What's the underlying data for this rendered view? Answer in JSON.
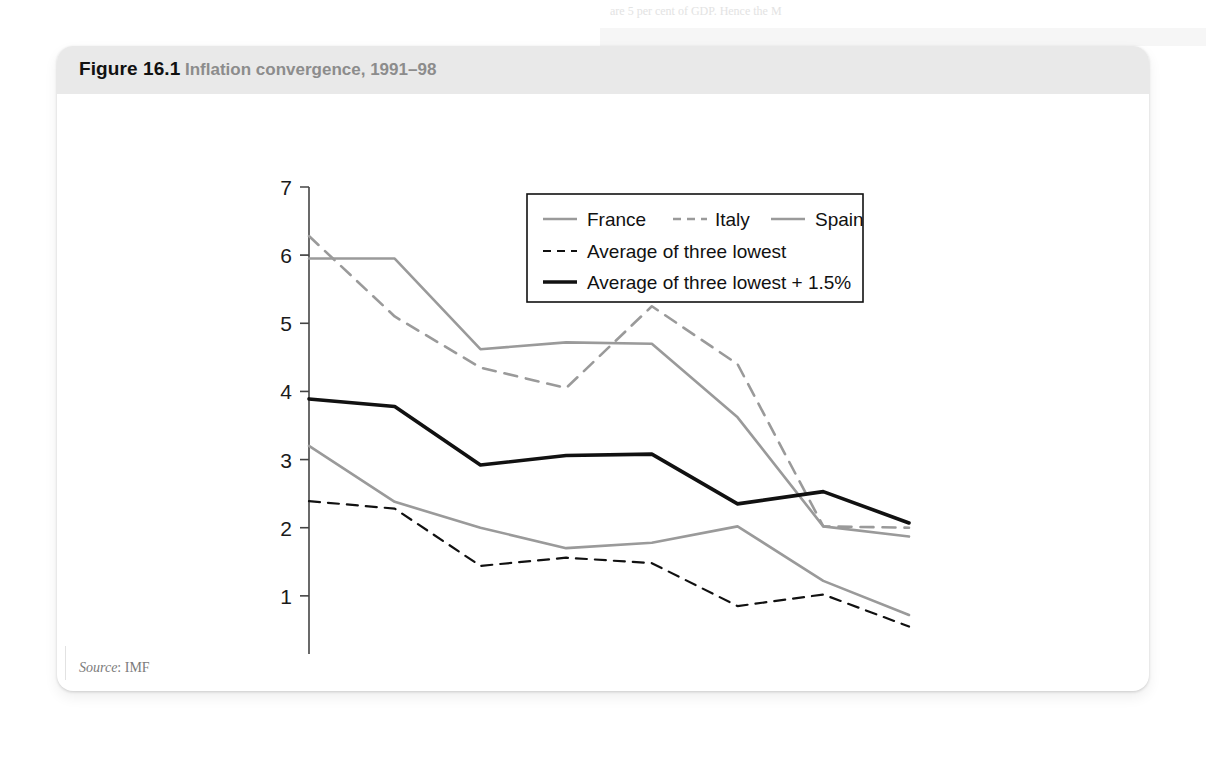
{
  "figure": {
    "label": "Figure 16.1",
    "caption": "Inflation convergence, 1991–98",
    "source_prefix": "Source",
    "source_value": "IMF"
  },
  "bleed_through_text": "are 5 per cent of GDP. Hence the M",
  "colors": {
    "banner": "#e9e9e9",
    "gray_line": "#9a9a9a",
    "black_line": "#111111",
    "axis": "#444444",
    "caption_gray": "#8c8c8c",
    "source_gray": "#7b7b7b"
  },
  "chart_data": {
    "type": "line",
    "title": "Inflation convergence, 1991–98",
    "xlabel": "",
    "ylabel": "",
    "x": [
      1991,
      1992,
      1993,
      1994,
      1995,
      1996,
      1997,
      1998
    ],
    "categories": [
      "1991",
      "1992",
      "1993",
      "1994",
      "1995",
      "1996",
      "1997",
      "1998"
    ],
    "xlim": [
      1991,
      1998
    ],
    "ylim": [
      0,
      7
    ],
    "yticks": [
      0,
      1,
      2,
      3,
      4,
      5,
      6,
      7
    ],
    "ytick_labels": [
      "0",
      "1",
      "2",
      "3",
      "4",
      "5",
      "6",
      "7"
    ],
    "grid": false,
    "legend_position": "top-right inside plot",
    "series": [
      {
        "name": "France",
        "style": "solid",
        "color": "#9a9a9a",
        "width": 2.6,
        "values": [
          3.2,
          2.38,
          2.0,
          1.7,
          1.78,
          2.02,
          1.22,
          0.72
        ]
      },
      {
        "name": "Italy",
        "style": "dashed",
        "color": "#9a9a9a",
        "width": 2.6,
        "values": [
          6.28,
          5.1,
          4.35,
          4.05,
          5.25,
          4.4,
          2.02,
          2.0
        ]
      },
      {
        "name": "Spain",
        "style": "solid",
        "color": "#9a9a9a",
        "width": 2.6,
        "values": [
          5.95,
          5.95,
          4.62,
          4.72,
          4.7,
          3.62,
          2.02,
          1.87
        ]
      },
      {
        "name": "Average of three lowest",
        "style": "dashed",
        "color": "#111111",
        "width": 2.2,
        "values": [
          2.39,
          2.28,
          1.44,
          1.56,
          1.48,
          0.85,
          1.02,
          0.55
        ]
      },
      {
        "name": "Average of three lowest + 1.5%",
        "style": "solid",
        "color": "#111111",
        "width": 3.6,
        "values": [
          3.89,
          3.78,
          2.92,
          3.06,
          3.08,
          2.35,
          2.53,
          2.07
        ]
      }
    ],
    "legend": [
      {
        "label": "France",
        "style": "solid",
        "color": "#9a9a9a"
      },
      {
        "label": "Italy",
        "style": "dashed",
        "color": "#9a9a9a"
      },
      {
        "label": "Spain",
        "style": "solid",
        "color": "#9a9a9a"
      },
      {
        "label": "Average of three lowest",
        "style": "dashed",
        "color": "#111111"
      },
      {
        "label": "Average of three lowest + 1.5%",
        "style": "solid",
        "color": "#111111"
      }
    ]
  }
}
